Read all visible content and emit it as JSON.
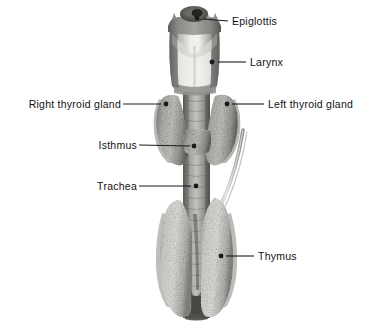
{
  "figure": {
    "background_color": "#ffffff",
    "leader_color": "#1a1a1a",
    "text_color": "#111111",
    "specimen_colors": {
      "larynx_light": "#e8e8e6",
      "larynx_mid": "#a9a9a6",
      "larynx_dark": "#6f6f6c",
      "epiglottis_dark": "#4a4a48",
      "thyroid_speckle_base": "#8e8e8a",
      "thyroid_speckle_light": "#cfcfca",
      "trachea_mid": "#9b9b97",
      "trachea_dark": "#5f5f5c",
      "thymus_base": "#d8d8d3",
      "thymus_speckle": "#9a9a95",
      "vessel": "#bdbdb8"
    }
  },
  "labels": [
    {
      "id": "epiglottis",
      "text": "Epiglottis",
      "side": "right",
      "text_x": 232,
      "text_y": 21,
      "anchor_x": 197,
      "anchor_y": 18,
      "line_x1": 203,
      "line_y1": 19,
      "line_x2": 228,
      "line_y2": 21
    },
    {
      "id": "larynx",
      "text": "Larynx",
      "side": "right",
      "text_x": 250,
      "text_y": 62,
      "anchor_x": 212,
      "anchor_y": 62,
      "line_x1": 218,
      "line_y1": 62,
      "line_x2": 246,
      "line_y2": 62
    },
    {
      "id": "right-thyroid-gland",
      "text": "Right thyroid gland",
      "side": "left",
      "text_x": 18,
      "text_y": 104,
      "anchor_x": 166,
      "anchor_y": 104,
      "line_x1": 123,
      "line_y1": 104,
      "line_x2": 161,
      "line_y2": 104
    },
    {
      "id": "left-thyroid-gland",
      "text": "Left thyroid gland",
      "side": "right",
      "text_x": 268,
      "text_y": 104,
      "anchor_x": 227,
      "anchor_y": 104,
      "line_x1": 232,
      "line_y1": 104,
      "line_x2": 264,
      "line_y2": 104
    },
    {
      "id": "isthmus",
      "text": "Isthmus",
      "side": "left",
      "text_x": 93,
      "text_y": 145,
      "anchor_x": 194,
      "anchor_y": 146,
      "line_x1": 139,
      "line_y1": 145,
      "line_x2": 190,
      "line_y2": 146
    },
    {
      "id": "trachea",
      "text": "Trachea",
      "side": "left",
      "text_x": 90,
      "text_y": 186,
      "anchor_x": 196,
      "anchor_y": 186,
      "line_x1": 139,
      "line_y1": 186,
      "line_x2": 191,
      "line_y2": 186
    },
    {
      "id": "thymus",
      "text": "Thymus",
      "side": "right",
      "text_x": 258,
      "text_y": 256,
      "anchor_x": 221,
      "anchor_y": 256,
      "line_x1": 226,
      "line_y1": 256,
      "line_x2": 254,
      "line_y2": 256
    }
  ]
}
